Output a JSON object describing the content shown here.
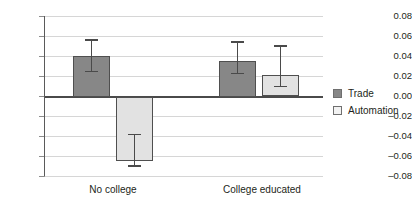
{
  "chart_data": {
    "type": "bar",
    "title": "",
    "subtitle": "",
    "xlabel": "",
    "ylabel": "",
    "categories": [
      "No college",
      "College educated"
    ],
    "ylim": [
      -0.08,
      0.08
    ],
    "yticks": [
      "0.08",
      "0.06",
      "0.04",
      "0.02",
      "0.00",
      "–0.02",
      "–0.04",
      "–0.06",
      "–0.08"
    ],
    "ytick_values": [
      0.08,
      0.06,
      0.04,
      0.02,
      0.0,
      -0.02,
      -0.04,
      -0.06,
      -0.08
    ],
    "grid": true,
    "legend_position": "right",
    "series": [
      {
        "name": "Trade",
        "color": "#878787",
        "values": [
          0.04,
          0.035
        ],
        "ci_low": [
          0.024,
          0.022
        ],
        "ci_high": [
          0.057,
          0.055
        ]
      },
      {
        "name": "Automation",
        "color": "#e2e2e2",
        "values": [
          -0.064,
          0.021
        ],
        "ci_low": [
          -0.07,
          0.009
        ],
        "ci_high": [
          -0.037,
          0.051
        ]
      }
    ]
  },
  "legend": {
    "items": [
      {
        "label": "Trade"
      },
      {
        "label": "Automation"
      }
    ]
  }
}
